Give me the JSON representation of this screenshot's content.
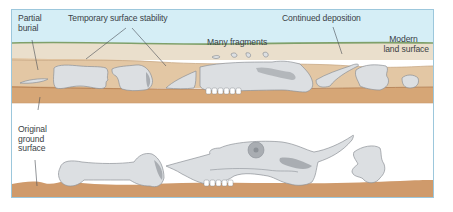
{
  "figure": {
    "panels": [
      {
        "id": "top",
        "description": "Later stage: bones partially buried, weathered and fragmented",
        "labels": {
          "partial_burial": [
            "Partial",
            "burial"
          ],
          "temporary_surface_stability": "Temporary surface stability",
          "many_fragments": "Many fragments",
          "continued_deposition": "Continued deposition",
          "modern_land_surface": [
            "Modern",
            "land surface"
          ]
        }
      },
      {
        "id": "bottom",
        "description": "Initial stage: bones lying on original ground surface",
        "labels": {
          "original_ground_surface": [
            "Original",
            "ground",
            "surface"
          ]
        }
      }
    ],
    "colors": {
      "frame": "#9cc7dc",
      "sky": "#d5eef6",
      "surface_line": "#7fa06a",
      "upper_sediment": "#eadfcc",
      "middle_sediment": "#e2c8a8",
      "lower_sediment": "#d9a87a",
      "ground": "#cf9a6b",
      "bone": "#dcdfe2",
      "bone_shadow": "#a9adb2",
      "bone_outline": "#8c9197",
      "label_text": "#3a3f46",
      "leader_line": "#4a4f55"
    }
  }
}
